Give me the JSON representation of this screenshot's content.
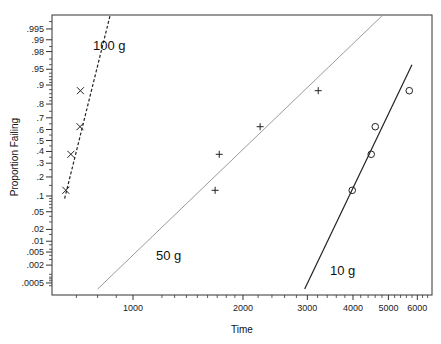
{
  "chart_data": {
    "type": "scatter",
    "title": "",
    "xlabel": "Time",
    "ylabel": "Proportion Failing",
    "x_scale": "log",
    "y_scale": "normal-probability",
    "xlim": [
      600,
      6600
    ],
    "ylim": [
      0.0003,
      0.998
    ],
    "grid": false,
    "legend": "inline labels",
    "x_ticks": [
      {
        "value": 1000,
        "label": "1000"
      },
      {
        "value": 2000,
        "label": "2000"
      },
      {
        "value": 3000,
        "label": "3000"
      },
      {
        "value": 4000,
        "label": "4000"
      },
      {
        "value": 5000,
        "label": "5000"
      },
      {
        "value": 6000,
        "label": "6000"
      }
    ],
    "x_minor_ticks": [
      700,
      800,
      900,
      1200,
      1300,
      1400,
      1500,
      1600,
      1700,
      1800,
      1900,
      2200,
      2400,
      2600,
      2800,
      3200,
      3400,
      3600,
      3800,
      4200,
      4400,
      4600,
      4800,
      5200,
      5400,
      5600,
      5800,
      6200,
      6400
    ],
    "y_ticks": [
      {
        "value": 0.995,
        "label": ".995"
      },
      {
        "value": 0.99,
        "label": ".99"
      },
      {
        "value": 0.98,
        "label": ".98"
      },
      {
        "value": 0.95,
        "label": ".95"
      },
      {
        "value": 0.9,
        "label": ".9"
      },
      {
        "value": 0.8,
        "label": ".8"
      },
      {
        "value": 0.7,
        "label": ".7"
      },
      {
        "value": 0.6,
        "label": ".6"
      },
      {
        "value": 0.5,
        "label": ".5"
      },
      {
        "value": 0.4,
        "label": ".4"
      },
      {
        "value": 0.3,
        "label": ".3"
      },
      {
        "value": 0.2,
        "label": ".2"
      },
      {
        "value": 0.1,
        "label": ".1"
      },
      {
        "value": 0.05,
        "label": ".05"
      },
      {
        "value": 0.02,
        "label": ".02"
      },
      {
        "value": 0.01,
        "label": ".01"
      },
      {
        "value": 0.005,
        "label": ".005"
      },
      {
        "value": 0.002,
        "label": ".002"
      },
      {
        "value": 0.0005,
        "label": ".0005"
      }
    ],
    "y_minor_ticks": [
      0.997,
      0.985,
      0.97,
      0.96,
      0.94,
      0.93,
      0.92,
      0.91,
      0.88,
      0.86,
      0.84,
      0.82,
      0.75,
      0.65,
      0.55,
      0.45,
      0.35,
      0.25,
      0.15,
      0.09,
      0.08,
      0.07,
      0.06,
      0.04,
      0.03,
      0.015,
      0.008,
      0.006,
      0.004,
      0.003,
      0.001,
      0.0008,
      0.0007,
      0.0006,
      0.0004
    ],
    "series": [
      {
        "name": "100 g",
        "label": "100 g",
        "marker": "x",
        "line_style": "dashed",
        "points": [
          {
            "x": 655,
            "y": 0.125
          },
          {
            "x": 676,
            "y": 0.375
          },
          {
            "x": 716,
            "y": 0.625
          },
          {
            "x": 718,
            "y": 0.875
          }
        ],
        "fit_line": {
          "x": [
            650,
            865
          ],
          "y": [
            0.09,
            0.998
          ]
        },
        "label_pos": {
          "x": 93,
          "y": 50
        }
      },
      {
        "name": "50 g",
        "label": "50 g",
        "marker": "+",
        "line_style": "thin",
        "points": [
          {
            "x": 1678,
            "y": 0.125
          },
          {
            "x": 1722,
            "y": 0.375
          },
          {
            "x": 2228,
            "y": 0.625
          },
          {
            "x": 3213,
            "y": 0.875
          }
        ],
        "fit_line": {
          "x": [
            800,
            4800
          ],
          "y": [
            0.0003,
            0.998
          ]
        },
        "label_pos": {
          "x": 156,
          "y": 260
        }
      },
      {
        "name": "10 g",
        "label": "10 g",
        "marker": "o",
        "line_style": "solid",
        "points": [
          {
            "x": 3981,
            "y": 0.125
          },
          {
            "x": 4487,
            "y": 0.375
          },
          {
            "x": 4603,
            "y": 0.625
          },
          {
            "x": 5703,
            "y": 0.875
          }
        ],
        "fit_line": {
          "x": [
            2950,
            5800
          ],
          "y": [
            0.0003,
            0.96
          ]
        },
        "label_pos": {
          "x": 330,
          "y": 275
        }
      }
    ]
  },
  "plot_area": {
    "left": 52,
    "top": 15,
    "right": 432,
    "bottom": 295
  },
  "colors": {
    "axis": "#333333",
    "line": "#222222",
    "marker": "#222222",
    "fit_50g": "#555555"
  }
}
